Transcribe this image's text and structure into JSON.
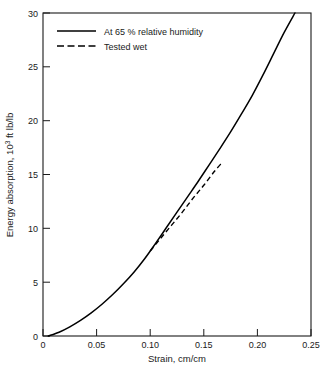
{
  "chart_data": {
    "type": "line",
    "title": "",
    "xlabel": "Strain, cm/cm",
    "ylabel_main": "Energy absorption, 10",
    "ylabel_sup": "3",
    "ylabel_tail": " ft lb/lb",
    "ylabel_full": "Energy absorption, 10³ ft lb/lb",
    "xlim": [
      0,
      0.25
    ],
    "ylim": [
      0,
      30
    ],
    "grid": false,
    "legend_position": "top-left-inside",
    "xticks": [
      0,
      0.05,
      0.1,
      0.15,
      0.2,
      0.25
    ],
    "xtick_labels": [
      "0",
      "0.05",
      "0.10",
      "0.15",
      "0.20",
      "0.25"
    ],
    "yticks": [
      0,
      5,
      10,
      15,
      20,
      25,
      30
    ],
    "ytick_labels": [
      "0",
      "5",
      "10",
      "15",
      "20",
      "25",
      "30"
    ],
    "series": [
      {
        "name": "At 65 % relative humidity",
        "style": "solid",
        "color": "#000000",
        "x": [
          0.005,
          0.015,
          0.025,
          0.035,
          0.045,
          0.055,
          0.065,
          0.075,
          0.085,
          0.095,
          0.105,
          0.115,
          0.125,
          0.135,
          0.145,
          0.155,
          0.165,
          0.175,
          0.185,
          0.195,
          0.205,
          0.215,
          0.225,
          0.235
        ],
        "y": [
          0.0,
          0.35,
          0.85,
          1.45,
          2.15,
          2.95,
          3.85,
          4.85,
          5.95,
          7.2,
          8.6,
          10.05,
          11.5,
          12.95,
          14.4,
          15.9,
          17.4,
          18.95,
          20.6,
          22.3,
          24.2,
          26.2,
          28.2,
          30.0
        ]
      },
      {
        "name": "Tested wet",
        "style": "dashed",
        "color": "#000000",
        "x": [
          0.1,
          0.11,
          0.12,
          0.13,
          0.14,
          0.15,
          0.16,
          0.167
        ],
        "y": [
          7.9,
          9.1,
          10.3,
          11.5,
          12.8,
          14.0,
          15.3,
          16.1
        ]
      }
    ],
    "legend": [
      {
        "label": "At 65 % relative humidity",
        "style": "solid"
      },
      {
        "label": "Tested wet",
        "style": "dashed"
      }
    ]
  }
}
